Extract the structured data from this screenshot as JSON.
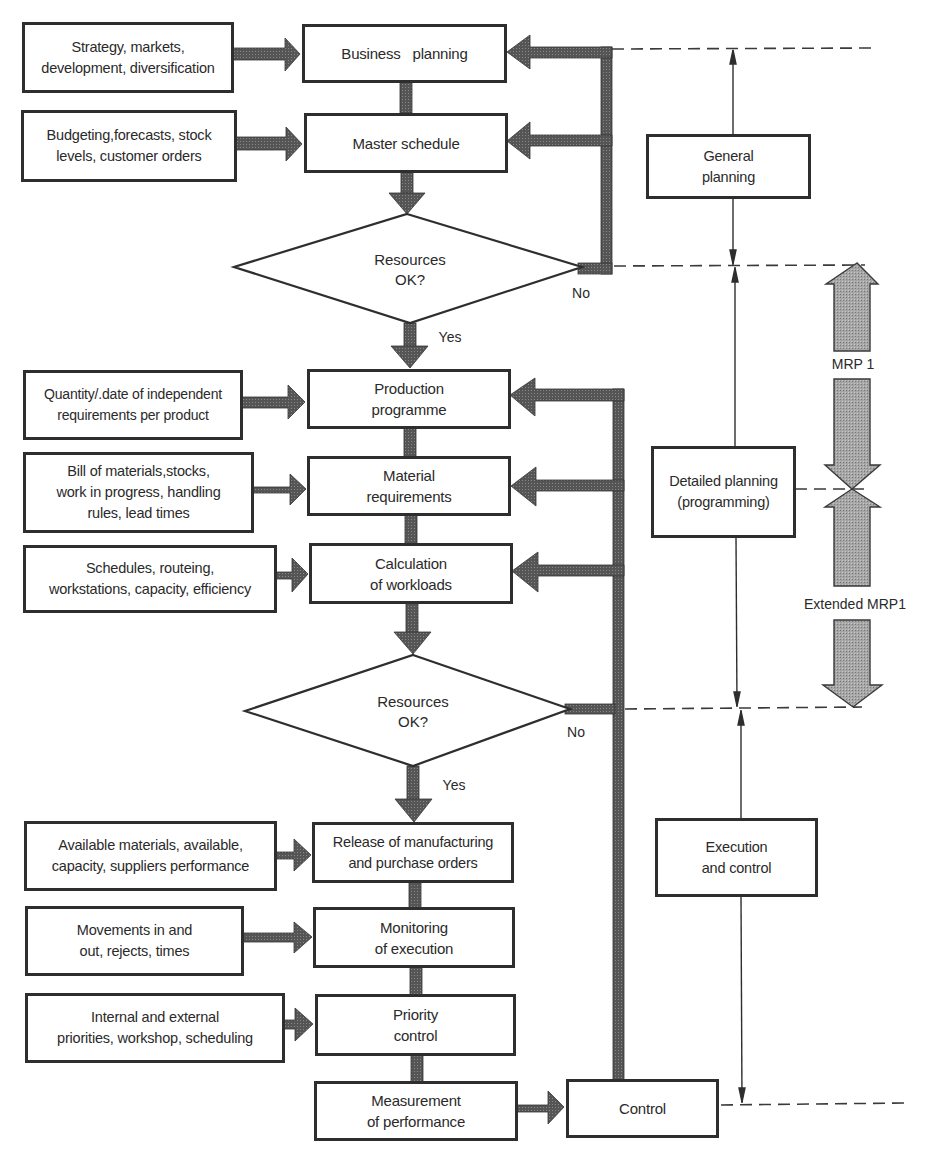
{
  "diagram": {
    "type": "flowchart",
    "colors": {
      "stroke": "#2e2e2e",
      "thick_arrow": "#4a4a4a",
      "mrp_arrow_fill": "#a8a8a8",
      "background": "#ffffff"
    },
    "inputs": [
      {
        "id": "in1",
        "text": "Strategy, markets,\ndevelopment, diversification",
        "target": "main1"
      },
      {
        "id": "in2",
        "text": "Budgeting,forecasts, stock\nlevels, customer orders",
        "target": "main2"
      },
      {
        "id": "in3",
        "text": "Quantity/.date of independent\nrequirements per product",
        "target": "main3"
      },
      {
        "id": "in4",
        "text": "Bill of materials,stocks,\nwork in progress, handling\nrules, lead times",
        "target": "main4"
      },
      {
        "id": "in5",
        "text": "Schedules, routeing,\nworkstations, capacity, efficiency",
        "target": "main5"
      },
      {
        "id": "in6",
        "text": "Available materials, available,\ncapacity, suppliers performance",
        "target": "main6"
      },
      {
        "id": "in7",
        "text": "Movements in and\nout, rejects, times",
        "target": "main7"
      },
      {
        "id": "in8",
        "text": "Internal and external\npriorities, workshop, scheduling",
        "target": "main8"
      }
    ],
    "main_steps": [
      {
        "id": "main1",
        "text": "Business   planning"
      },
      {
        "id": "main2",
        "text": "Master schedule"
      },
      {
        "id": "main3",
        "text": "Production\nprogramme"
      },
      {
        "id": "main4",
        "text": "Material\nrequirements"
      },
      {
        "id": "main5",
        "text": "Calculation\nof workloads"
      },
      {
        "id": "main6",
        "text": "Release of manufacturing\nand purchase orders"
      },
      {
        "id": "main7",
        "text": "Monitoring\nof execution"
      },
      {
        "id": "main8",
        "text": "Priority\ncontrol"
      },
      {
        "id": "main9",
        "text": "Measurement\nof performance"
      }
    ],
    "control_box": {
      "text": "Control"
    },
    "decisions": [
      {
        "id": "dec1",
        "text": "Resources\nOK?",
        "yes_label": "Yes",
        "no_label": "No"
      },
      {
        "id": "dec2",
        "text": "Resources\nOK?",
        "yes_label": "Yes",
        "no_label": "No"
      }
    ],
    "phases": [
      {
        "id": "phase1",
        "text": "General\nplanning"
      },
      {
        "id": "phase2",
        "text": "Detailed planning\n(programming)"
      },
      {
        "id": "phase3",
        "text": "Execution\nand control"
      }
    ],
    "scope_arrows": [
      {
        "id": "mrp1",
        "text": "MRP 1"
      },
      {
        "id": "mrp1ext",
        "text": "Extended MRP1"
      }
    ]
  }
}
